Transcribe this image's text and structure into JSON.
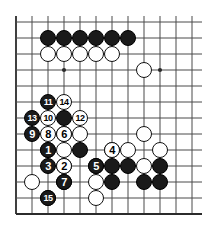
{
  "diagram": {
    "type": "go-board-diagram",
    "board": {
      "columns": 12,
      "rows": 13,
      "origin_x": 16,
      "origin_y": 22,
      "spacing": 16,
      "line_color": "#4a4a4a",
      "edge_color": "#2b2b2b",
      "background": "#ffffff",
      "stone_radius": 8,
      "star_points": [
        {
          "col": 3,
          "row": 3
        },
        {
          "col": 9,
          "row": 3
        }
      ]
    },
    "colors": {
      "black_stone": "#1a1a1a",
      "white_stone": "#ffffff",
      "black_label_text": "#ffffff",
      "white_label_text": "#000000"
    },
    "plain_stones": [
      {
        "col": 2,
        "row": 1,
        "color": "black"
      },
      {
        "col": 3,
        "row": 1,
        "color": "black"
      },
      {
        "col": 4,
        "row": 1,
        "color": "black"
      },
      {
        "col": 5,
        "row": 1,
        "color": "black"
      },
      {
        "col": 6,
        "row": 1,
        "color": "black"
      },
      {
        "col": 7,
        "row": 1,
        "color": "black"
      },
      {
        "col": 2,
        "row": 2,
        "color": "white"
      },
      {
        "col": 3,
        "row": 2,
        "color": "white"
      },
      {
        "col": 4,
        "row": 2,
        "color": "white"
      },
      {
        "col": 5,
        "row": 2,
        "color": "white"
      },
      {
        "col": 6,
        "row": 2,
        "color": "white"
      },
      {
        "col": 8,
        "row": 3,
        "color": "white"
      },
      {
        "col": 3,
        "row": 6,
        "color": "black"
      },
      {
        "col": 3,
        "row": 7,
        "color": "black"
      },
      {
        "col": 4,
        "row": 7,
        "color": "white"
      },
      {
        "col": 8,
        "row": 7,
        "color": "white"
      },
      {
        "col": 2,
        "row": 8,
        "color": "white"
      },
      {
        "col": 3,
        "row": 8,
        "color": "white"
      },
      {
        "col": 4,
        "row": 8,
        "color": "black"
      },
      {
        "col": 6,
        "row": 8,
        "color": "white"
      },
      {
        "col": 7,
        "row": 8,
        "color": "white"
      },
      {
        "col": 9,
        "row": 8,
        "color": "white"
      },
      {
        "col": 3,
        "row": 9,
        "color": "black"
      },
      {
        "col": 5,
        "row": 9,
        "color": "black"
      },
      {
        "col": 6,
        "row": 9,
        "color": "black"
      },
      {
        "col": 7,
        "row": 9,
        "color": "black"
      },
      {
        "col": 8,
        "row": 9,
        "color": "white"
      },
      {
        "col": 9,
        "row": 9,
        "color": "black"
      },
      {
        "col": 1,
        "row": 10,
        "color": "white"
      },
      {
        "col": 3,
        "row": 10,
        "color": "black"
      },
      {
        "col": 5,
        "row": 10,
        "color": "white"
      },
      {
        "col": 6,
        "row": 10,
        "color": "black"
      },
      {
        "col": 8,
        "row": 10,
        "color": "black"
      },
      {
        "col": 9,
        "row": 10,
        "color": "black"
      },
      {
        "col": 2,
        "row": 11,
        "color": "white"
      },
      {
        "col": 5,
        "row": 11,
        "color": "white"
      }
    ],
    "numbered_moves": [
      {
        "number": "1",
        "col": 2,
        "row": 8,
        "color": "black"
      },
      {
        "number": "2",
        "col": 3,
        "row": 9,
        "color": "white"
      },
      {
        "number": "3",
        "col": 2,
        "row": 9,
        "color": "black"
      },
      {
        "number": "4",
        "col": 6,
        "row": 8,
        "color": "white"
      },
      {
        "number": "5",
        "col": 5,
        "row": 9,
        "color": "black"
      },
      {
        "number": "6",
        "col": 3,
        "row": 7,
        "color": "white"
      },
      {
        "number": "7",
        "col": 3,
        "row": 10,
        "color": "black"
      },
      {
        "number": "8",
        "col": 2,
        "row": 7,
        "color": "white"
      },
      {
        "number": "9",
        "col": 1,
        "row": 7,
        "color": "black"
      },
      {
        "number": "10",
        "col": 2,
        "row": 6,
        "color": "white"
      },
      {
        "number": "11",
        "col": 2,
        "row": 5,
        "color": "black"
      },
      {
        "number": "12",
        "col": 4,
        "row": 6,
        "color": "white"
      },
      {
        "number": "13",
        "col": 1,
        "row": 6,
        "color": "black"
      },
      {
        "number": "14",
        "col": 3,
        "row": 5,
        "color": "white"
      },
      {
        "number": "15",
        "col": 2,
        "row": 11,
        "color": "black"
      }
    ]
  }
}
